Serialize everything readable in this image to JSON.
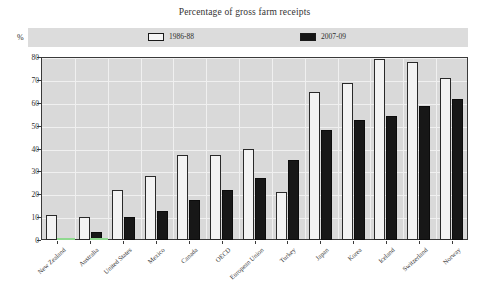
{
  "chart_data": {
    "type": "bar",
    "title": "Percentage of gross farm receipts",
    "xlabel": "",
    "ylabel": "%",
    "ylim": [
      0,
      80
    ],
    "yticks": [
      0,
      10,
      20,
      30,
      40,
      50,
      60,
      70,
      80
    ],
    "grid": true,
    "legend_position": "top",
    "categories": [
      "New Zealand",
      "Australia",
      "United States",
      "Mexico",
      "Canada",
      "OECD",
      "European Union",
      "Turkey",
      "Japan",
      "Korea",
      "Iceland",
      "Switzerland",
      "Norway"
    ],
    "series": [
      {
        "name": "1986-88",
        "color": "#f3f3f3",
        "values": [
          11,
          10,
          22,
          28,
          37,
          37,
          40,
          21,
          64.5,
          68.5,
          79,
          78,
          71
        ]
      },
      {
        "name": "2007-09",
        "color": "#171717",
        "values": [
          0.5,
          3.5,
          10,
          12.5,
          17.5,
          22,
          27,
          35,
          48,
          52.5,
          54,
          58.5,
          61.5
        ]
      }
    ]
  },
  "legend": {
    "items": [
      {
        "label": "1986-88",
        "swatch": "light"
      },
      {
        "label": "2007-09",
        "swatch": "dark"
      }
    ]
  },
  "axis": {
    "percent_symbol": "%"
  }
}
